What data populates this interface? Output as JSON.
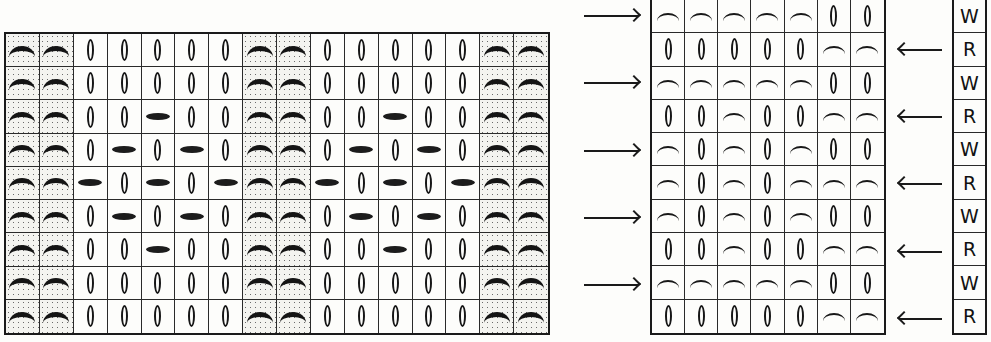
{
  "legend": {
    "P": "purl (shaded, bold arc)",
    "K": "knit / elongated stitch (oval)",
    "S": "slipped stitch (horizontal bar)",
    "a": "purl arc",
    "k": "knit oval"
  },
  "colors": {
    "ink": "#1a1a1a",
    "paper": "#fdfdfb",
    "shading_dots": "#6b6b6b"
  },
  "left_chart": {
    "columns": 16,
    "rows": 9,
    "shaded_columns": [
      1,
      2,
      8,
      9,
      15,
      16
    ],
    "grid": [
      [
        "P",
        "P",
        "K",
        "K",
        "K",
        "K",
        "K",
        "P",
        "P",
        "K",
        "K",
        "K",
        "K",
        "K",
        "P",
        "P"
      ],
      [
        "P",
        "P",
        "K",
        "K",
        "K",
        "K",
        "K",
        "P",
        "P",
        "K",
        "K",
        "K",
        "K",
        "K",
        "P",
        "P"
      ],
      [
        "P",
        "P",
        "K",
        "K",
        "S",
        "K",
        "K",
        "P",
        "P",
        "K",
        "K",
        "S",
        "K",
        "K",
        "P",
        "P"
      ],
      [
        "P",
        "P",
        "K",
        "S",
        "K",
        "S",
        "K",
        "P",
        "P",
        "K",
        "S",
        "K",
        "S",
        "K",
        "P",
        "P"
      ],
      [
        "P",
        "P",
        "S",
        "K",
        "S",
        "K",
        "S",
        "P",
        "P",
        "S",
        "K",
        "S",
        "K",
        "S",
        "P",
        "P"
      ],
      [
        "P",
        "P",
        "K",
        "S",
        "K",
        "S",
        "K",
        "P",
        "P",
        "K",
        "S",
        "K",
        "S",
        "K",
        "P",
        "P"
      ],
      [
        "P",
        "P",
        "K",
        "K",
        "S",
        "K",
        "K",
        "P",
        "P",
        "K",
        "K",
        "S",
        "K",
        "K",
        "P",
        "P"
      ],
      [
        "P",
        "P",
        "K",
        "K",
        "K",
        "K",
        "K",
        "P",
        "P",
        "K",
        "K",
        "K",
        "K",
        "K",
        "P",
        "P"
      ],
      [
        "P",
        "P",
        "K",
        "K",
        "K",
        "K",
        "K",
        "P",
        "P",
        "K",
        "K",
        "K",
        "K",
        "K",
        "P",
        "P"
      ]
    ]
  },
  "right_chart": {
    "columns": 7,
    "rows": 10,
    "grid": [
      [
        "a",
        "a",
        "a",
        "a",
        "a",
        "k",
        "k"
      ],
      [
        "k",
        "k",
        "k",
        "k",
        "k",
        "a",
        "a"
      ],
      [
        "a",
        "a",
        "a",
        "a",
        "a",
        "k",
        "k"
      ],
      [
        "k",
        "k",
        "a",
        "k",
        "k",
        "a",
        "a"
      ],
      [
        "a",
        "k",
        "a",
        "k",
        "a",
        "k",
        "k"
      ],
      [
        "a",
        "k",
        "a",
        "k",
        "a",
        "a",
        "a"
      ],
      [
        "a",
        "k",
        "a",
        "k",
        "a",
        "k",
        "k"
      ],
      [
        "k",
        "k",
        "a",
        "k",
        "k",
        "a",
        "a"
      ],
      [
        "a",
        "a",
        "a",
        "a",
        "a",
        "k",
        "k"
      ],
      [
        "k",
        "k",
        "k",
        "k",
        "k",
        "a",
        "a"
      ]
    ],
    "arrows": [
      "right",
      "left",
      "right",
      "left",
      "right",
      "left",
      "right",
      "left",
      "right",
      "left"
    ],
    "row_labels": [
      "W",
      "R",
      "W",
      "R",
      "W",
      "R",
      "W",
      "R",
      "W",
      "R"
    ]
  }
}
